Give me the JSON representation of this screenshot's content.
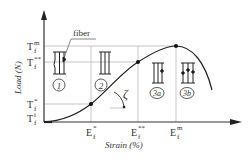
{
  "diagram": {
    "type": "load-strain curve with fiber damage stages",
    "axes": {
      "x_label": "Strain (%)",
      "y_label": "Load (N)"
    },
    "y_ticks": [
      {
        "base": "T",
        "sub": "f",
        "sup": "m",
        "y": 46
      },
      {
        "base": "T",
        "sub": "f",
        "sup": "**",
        "y": 62
      },
      {
        "base": "T",
        "sub": "f",
        "sup": "*",
        "y": 104
      },
      {
        "base": "T",
        "sub": "f",
        "sup": "i",
        "y": 122
      }
    ],
    "x_ticks": [
      {
        "base": "E",
        "sub": "f",
        "sup": "*",
        "x": 91
      },
      {
        "base": "E",
        "sub": "f",
        "sup": "**",
        "x": 138
      },
      {
        "base": "E",
        "sub": "f",
        "sup": "m",
        "x": 176
      }
    ],
    "annotations": {
      "fiber_label": "fiber",
      "angle_label": "ζ"
    },
    "stages": [
      {
        "label": "1",
        "x": 59
      },
      {
        "label": "2",
        "x": 101
      },
      {
        "label": "3a",
        "x": 149
      },
      {
        "label": "3b",
        "x": 188
      }
    ],
    "colors": {
      "line": "#333333",
      "grid": "#aaaaaa",
      "background": "#ffffff"
    }
  }
}
